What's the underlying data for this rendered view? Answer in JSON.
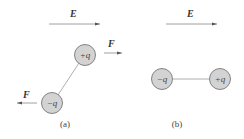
{
  "diagram": {
    "colors": {
      "line": "#888888",
      "circle_fill": "#d3d3d3",
      "circle_stroke": "#777777",
      "text": "#333333"
    },
    "panel_a": {
      "field_label": "E",
      "positive_charge": "+q",
      "negative_charge": "−q",
      "force_right_label": "F",
      "force_left_label": "F",
      "caption": "(a)"
    },
    "panel_b": {
      "field_label": "E",
      "negative_charge": "−q",
      "positive_charge": "+q",
      "caption": "(b)"
    }
  }
}
